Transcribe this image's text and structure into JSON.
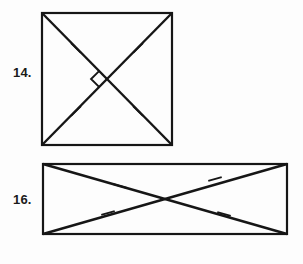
{
  "worksheet": {
    "background_color": "#fdfdfd",
    "ink_color": "#161616",
    "problems": [
      {
        "number_label": "14.",
        "shape": "square",
        "description": "square with both diagonals drawn, congruence ticks on each half-diagonal, right angle marker at intersection",
        "has_right_angle_marker": true,
        "tick_count": 4,
        "diagonal_count": 2
      },
      {
        "number_label": "16.",
        "shape": "rectangle",
        "description": "rectangle with both diagonals drawn, congruence ticks on each half-diagonal, no right angle marker",
        "has_right_angle_marker": false,
        "tick_count": 4,
        "diagonal_count": 2
      }
    ]
  },
  "figure_14": {
    "label": "14.",
    "outline": {
      "x": 42,
      "y": 13,
      "width": 130,
      "height": 132
    },
    "diagonals": [
      {
        "name": "diagonal-tl-br",
        "x1": 42,
        "y1": 13,
        "x2": 172,
        "y2": 145
      },
      {
        "name": "diagonal-tr-bl",
        "x1": 172,
        "y1": 13,
        "x2": 42,
        "y2": 145
      }
    ],
    "ticks": [
      {
        "name": "tick-upper-left",
        "cx": 76,
        "cy": 48,
        "angle_deg": 45
      },
      {
        "name": "tick-upper-right",
        "cx": 138,
        "cy": 48,
        "angle_deg": -45
      },
      {
        "name": "tick-lower-left",
        "cx": 76,
        "cy": 111,
        "angle_deg": -45
      },
      {
        "name": "tick-lower-right",
        "cx": 138,
        "cy": 111,
        "angle_deg": 45
      }
    ],
    "center": {
      "x": 107,
      "y": 79
    },
    "right_angle_marker": {
      "size": 11,
      "position": "left-of-center"
    }
  },
  "figure_16": {
    "label": "16.",
    "outline": {
      "x": 43,
      "y": 164,
      "width": 244,
      "height": 70
    },
    "diagonals": [
      {
        "name": "diagonal-tl-br",
        "x1": 43,
        "y1": 164,
        "x2": 287,
        "y2": 234
      },
      {
        "name": "diagonal-bl-tr",
        "x1": 43,
        "y1": 234,
        "x2": 287,
        "y2": 164
      }
    ],
    "ticks": [
      {
        "name": "tick-upper-left",
        "cx": 120,
        "cy": 186,
        "angle_deg": 16
      },
      {
        "name": "tick-upper-right",
        "cx": 215,
        "cy": 179,
        "angle_deg": -16
      },
      {
        "name": "tick-lower-left",
        "cx": 108,
        "cy": 213,
        "angle_deg": -16
      },
      {
        "name": "tick-lower-right",
        "cx": 224,
        "cy": 214,
        "angle_deg": 16
      }
    ],
    "center": {
      "x": 165,
      "y": 199
    },
    "right_angle_marker": null
  }
}
